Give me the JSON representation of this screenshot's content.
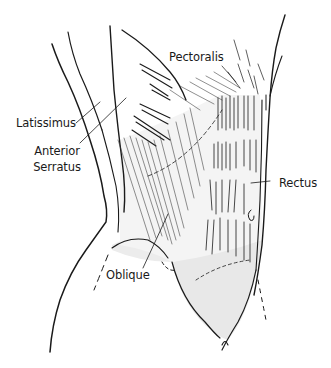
{
  "diagram": {
    "labels": [
      {
        "id": "pectoralis",
        "text": "Pectoralis"
      },
      {
        "id": "latissimus",
        "text": "Latissimus"
      },
      {
        "id": "anterior_serratus_line1",
        "text": "Anterior"
      },
      {
        "id": "anterior_serratus_line2",
        "text": "Serratus"
      },
      {
        "id": "rectus",
        "text": "Rectus"
      },
      {
        "id": "oblique",
        "text": "Oblique"
      }
    ],
    "colors": {
      "ink": "#1a1a1a",
      "shade": "#e6e6e6",
      "background": "#ffffff"
    }
  }
}
